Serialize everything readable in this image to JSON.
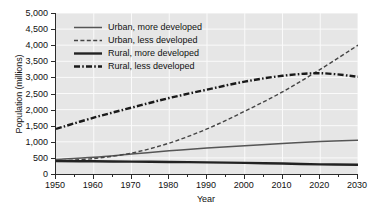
{
  "chart_data": {
    "type": "line",
    "title": "",
    "xlabel": "Year",
    "ylabel": "Population (millions)",
    "xlim": [
      1950,
      2030
    ],
    "ylim": [
      0,
      5000
    ],
    "grid": true,
    "legend_position": "top-left",
    "x_ticks": [
      1950,
      1960,
      1970,
      1980,
      1990,
      2000,
      2010,
      2020,
      2030
    ],
    "x_tick_labels": [
      "1950",
      "1960",
      "1970",
      "1980",
      "1990",
      "2000",
      "2010",
      "2020",
      "2030"
    ],
    "y_ticks": [
      0,
      500,
      1000,
      1500,
      2000,
      2500,
      3000,
      3500,
      4000,
      4500,
      5000
    ],
    "y_tick_labels": [
      "0",
      "500",
      "1,000",
      "1,500",
      "2,000",
      "2,500",
      "3,000",
      "3,500",
      "4,000",
      "4,500",
      "5,000"
    ],
    "x": [
      1950,
      1960,
      1970,
      1980,
      1990,
      2000,
      2010,
      2020,
      2030
    ],
    "series": [
      {
        "name": "Urban, more developed",
        "style": "solid",
        "width": 1.5,
        "color": "#555555",
        "values": [
          450,
          520,
          620,
          720,
          810,
          880,
          950,
          1010,
          1050
        ]
      },
      {
        "name": "Urban, less developed",
        "style": "dashed",
        "width": 1.4,
        "color": "#444444",
        "values": [
          400,
          480,
          650,
          960,
          1400,
          1950,
          2550,
          3250,
          4000
        ]
      },
      {
        "name": "Rural, more developed",
        "style": "solid",
        "width": 2.4,
        "color": "#222222",
        "values": [
          400,
          395,
          385,
          375,
          360,
          345,
          325,
          300,
          285
        ]
      },
      {
        "name": "Rural, less developed",
        "style": "dashdot",
        "width": 2.4,
        "color": "#1a1a1a",
        "values": [
          1400,
          1750,
          2060,
          2360,
          2620,
          2870,
          3050,
          3130,
          3020
        ]
      }
    ],
    "annotations": [
      "Urban less developed curve crosses rural less developed curve near 2018 at about 3,100 million"
    ]
  },
  "legend": {
    "items": [
      {
        "label": "Urban, more developed",
        "style": "solid",
        "width": 1.5
      },
      {
        "label": "Urban, less developed",
        "style": "dashed",
        "width": 1.4
      },
      {
        "label": "Rural, more developed",
        "style": "solid",
        "width": 2.4
      },
      {
        "label": "Rural, less developed",
        "style": "dashdot",
        "width": 2.4
      }
    ]
  },
  "colors": {
    "plot_background": "#e6e6e6",
    "figure_background": "#ffffff",
    "gridline": "#fafafa",
    "axis": "#2b2b2b",
    "text": "#111111"
  }
}
